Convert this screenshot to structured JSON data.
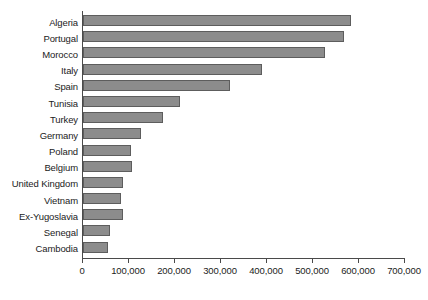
{
  "chart_data": {
    "type": "bar",
    "orientation": "horizontal",
    "title": "",
    "xlabel": "",
    "ylabel": "",
    "xlim": [
      0,
      700000
    ],
    "xticks": [
      0,
      100000,
      200000,
      300000,
      400000,
      500000,
      600000,
      700000
    ],
    "xtick_labels": [
      "0",
      "100,000",
      "200,000",
      "300,000",
      "400,000",
      "500,000",
      "600,000",
      "700,000"
    ],
    "grid": false,
    "legend": null,
    "bar_color": "#8c8c8c",
    "bar_border_color": "#5d5d5d",
    "axis_color": "#4a4a4a",
    "categories": [
      "Algeria",
      "Portugal",
      "Morocco",
      "Italy",
      "Spain",
      "Tunisia",
      "Turkey",
      "Germany",
      "Poland",
      "Belgium",
      "United Kingdom",
      "Vietnam",
      "Ex-Yugoslavia",
      "Senegal",
      "Cambodia"
    ],
    "values": [
      583000,
      568000,
      526000,
      390000,
      319000,
      210000,
      173000,
      126000,
      104000,
      107000,
      87000,
      83000,
      87000,
      59000,
      55000
    ]
  }
}
